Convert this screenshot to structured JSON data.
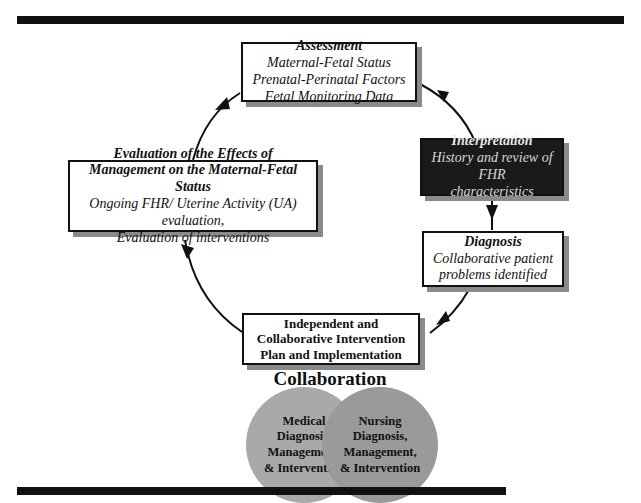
{
  "diagram": {
    "assessment": {
      "title": "Assessment",
      "lines": [
        "Maternal-Fetal Status",
        "Prenatal-Perinatal Factors",
        "Fetal Monitoring Data"
      ]
    },
    "interpretation": {
      "title": "Interpretation",
      "lines": [
        "History and review of FHR",
        "characteristics"
      ]
    },
    "diagnosis": {
      "title": "Diagnosis",
      "lines": [
        "Collaborative patient",
        "problems identified"
      ]
    },
    "intervention": {
      "lines": [
        "Independent and",
        "Collaborative Intervention",
        "Plan and Implementation"
      ]
    },
    "evaluation": {
      "title_lines": [
        "Evaluation of the Effects of",
        "Management on the Maternal-Fetal Status"
      ],
      "lines": [
        "Ongoing FHR/ Uterine Activity (UA) evaluation,",
        "Evaluation of interventions"
      ]
    },
    "collaboration": {
      "title": "Collaboration",
      "medical": [
        "Medical",
        "Diagnosis,",
        "Management,",
        "& Intervention"
      ],
      "nursing": [
        "Nursing",
        "Diagnosis,",
        "Management,",
        "& Intervention"
      ]
    }
  },
  "colors": {
    "bar": "#111111",
    "dark_box": "#1a1a1a",
    "shadow": "#8a8a8a",
    "circle_medical": "#a9a9a9",
    "circle_nursing": "#9a9a9a"
  }
}
